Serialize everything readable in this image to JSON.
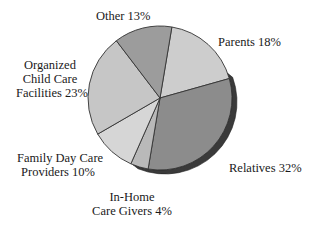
{
  "chart_data": {
    "type": "pie",
    "title": "",
    "start_angle_deg": -80.5,
    "direction": "clockwise",
    "three_d": true,
    "slices": [
      {
        "label": "Parents",
        "value": 18,
        "color": "#cdcdcd"
      },
      {
        "label": "Relatives",
        "value": 32,
        "color": "#8c8c8c"
      },
      {
        "label": "In-Home Care Givers",
        "value": 4,
        "color": "#b9b9b9"
      },
      {
        "label": "Family Day Care Providers",
        "value": 10,
        "color": "#d6d6d6"
      },
      {
        "label": "Organized Child Care Facilities",
        "value": 23,
        "color": "#c6c6c6"
      },
      {
        "label": "Other",
        "value": 13,
        "color": "#9c9c9c"
      }
    ],
    "categories": [
      "Parents",
      "Relatives",
      "In-Home Care Givers",
      "Family Day Care Providers",
      "Organized Child Care Facilities",
      "Other"
    ],
    "values": [
      18,
      32,
      4,
      10,
      23,
      13
    ],
    "units": "%"
  },
  "labels": {
    "other": {
      "lines": [
        "Other 13%"
      ]
    },
    "parents": {
      "lines": [
        "Parents 18%"
      ]
    },
    "organized": {
      "lines": [
        "Organized",
        "Child Care",
        "Facilities 23%"
      ]
    },
    "family": {
      "lines": [
        "Family Day Care",
        "Providers 10%"
      ]
    },
    "inhome": {
      "lines": [
        "In-Home",
        "Care Givers 4%"
      ]
    },
    "relatives": {
      "lines": [
        "Relatives 32%"
      ]
    }
  },
  "style": {
    "edge_color": "#333333",
    "extrusion_color": "#3a3a3a"
  }
}
